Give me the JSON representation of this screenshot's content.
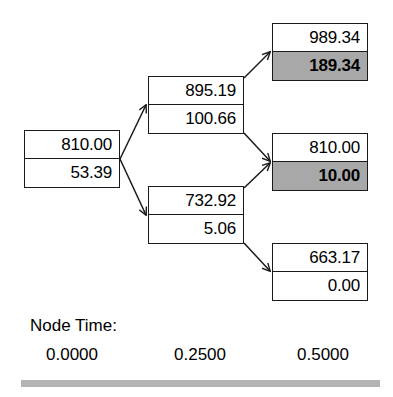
{
  "diagram": {
    "shade_color": "#a8a8a8",
    "line_color": "#1a1a1a",
    "rule_color": "#b4b4b4",
    "nodes": [
      {
        "id": "root",
        "name": "node-root",
        "upper_value": "810.00",
        "lower_value": "53.39",
        "upper_shaded": false,
        "lower_shaded": false,
        "time": "0.0000"
      },
      {
        "id": "up",
        "name": "node-up",
        "upper_value": "895.19",
        "lower_value": "100.66",
        "upper_shaded": false,
        "lower_shaded": false,
        "time": "0.2500"
      },
      {
        "id": "down",
        "name": "node-down",
        "upper_value": "732.92",
        "lower_value": "5.06",
        "upper_shaded": false,
        "lower_shaded": false,
        "time": "0.2500"
      },
      {
        "id": "upup",
        "name": "node-up-up",
        "upper_value": "989.34",
        "lower_value": "189.34",
        "upper_shaded": false,
        "lower_shaded": true,
        "time": "0.5000"
      },
      {
        "id": "updown",
        "name": "node-up-down",
        "upper_value": "810.00",
        "lower_value": "10.00",
        "upper_shaded": false,
        "lower_shaded": true,
        "time": "0.5000"
      },
      {
        "id": "downdown",
        "name": "node-down-down",
        "upper_value": "663.17",
        "lower_value": "0.00",
        "upper_shaded": false,
        "lower_shaded": false,
        "time": "0.5000"
      }
    ],
    "edges": [
      {
        "from": "root",
        "to": "up"
      },
      {
        "from": "root",
        "to": "down"
      },
      {
        "from": "up",
        "to": "upup"
      },
      {
        "from": "up",
        "to": "updown"
      },
      {
        "from": "down",
        "to": "updown"
      },
      {
        "from": "down",
        "to": "downdown"
      }
    ]
  },
  "footer": {
    "node_time_label": "Node Time:",
    "times": [
      "0.0000",
      "0.2500",
      "0.5000"
    ]
  }
}
